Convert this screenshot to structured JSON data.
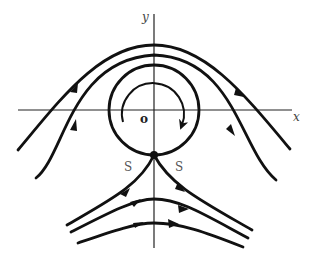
{
  "diagram": {
    "type": "flow streamlines around rotating cylinder",
    "labels": {
      "x_axis": "x",
      "y_axis": "y",
      "origin": "o",
      "stagnation_left": "S",
      "stagnation_right": "S"
    },
    "colors": {
      "line": "#111111",
      "axis": "#222222",
      "background": "#ffffff"
    }
  }
}
